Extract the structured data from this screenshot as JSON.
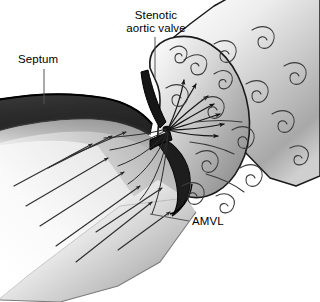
{
  "figure": {
    "background_color": "#ffffff",
    "width": 320,
    "height": 302
  },
  "labels": {
    "septum": "Septum",
    "stenotic_line1": "Stenotic",
    "stenotic_line2": "aortic valve",
    "amvl": "AMVL"
  },
  "colors": {
    "septum_dark": "#2b2b2b",
    "leaflet_dark": "#1f1f1f",
    "tissue_light": "#fbfbfb",
    "tissue_mid": "#b9b9b9",
    "tissue_shadow": "#8e8e8e",
    "outline": "#1a1a1a",
    "flow_line": "#333333",
    "label_text": "#000000",
    "leader_line": "#555555"
  },
  "anatomy": {
    "septum_name": "interventricular septum",
    "valve_name": "stenotic aortic valve",
    "leaflet_name": "anterior mitral valve leaflet",
    "chamber_name": "left ventricular outflow tract",
    "vessel_name": "ascending aorta"
  },
  "flow": {
    "laminar_arrow_count": 9,
    "jet_arrow_count": 7,
    "swirl_count": 16,
    "jet_origin": {
      "x": 168,
      "y": 130
    },
    "laminar_direction": "up-right toward valve orifice",
    "jet_direction": "fanning up-right into aorta",
    "turbulence_label": "post-stenotic turbulence"
  }
}
